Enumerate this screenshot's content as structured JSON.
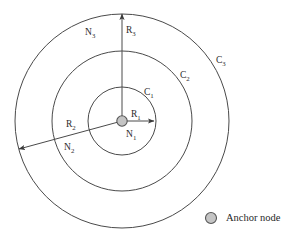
{
  "figure": {
    "background_color": "#ffffff",
    "stroke_color": "#4a4a4a",
    "node_fill_color": "#c4c4c4",
    "node_stroke_color": "#555555",
    "text_color": "#2b2b2b",
    "center": {
      "x": 122,
      "y": 121
    },
    "circles": [
      {
        "id": "C1",
        "label": "C",
        "subscript": "1",
        "radius": 34,
        "label_x": 144,
        "label_y": 88
      },
      {
        "id": "C2",
        "label": "C",
        "subscript": "2",
        "radius": 70,
        "label_x": 180,
        "label_y": 71
      },
      {
        "id": "C3",
        "label": "C",
        "subscript": "3",
        "radius": 107,
        "label_x": 216,
        "label_y": 56
      }
    ],
    "radii_arrows": [
      {
        "id": "R1",
        "label": "R",
        "subscript": "1",
        "angle_deg": 0,
        "length": 34,
        "label_x": 131,
        "label_y": 110
      },
      {
        "id": "R2",
        "label": "R",
        "subscript": "2",
        "angle_deg": 195,
        "length": 107,
        "label_x": 66,
        "label_y": 120
      },
      {
        "id": "R3",
        "label": "R",
        "subscript": "3",
        "angle_deg": 270,
        "length": 109,
        "label_x": 126,
        "label_y": 26
      }
    ],
    "region_labels": [
      {
        "id": "N1",
        "label": "N",
        "subscript": "1",
        "x": 126,
        "y": 130
      },
      {
        "id": "N2",
        "label": "N",
        "subscript": "2",
        "x": 64,
        "y": 143
      },
      {
        "id": "N3",
        "label": "N",
        "subscript": "3",
        "x": 85,
        "y": 28
      }
    ]
  },
  "legend": {
    "marker_name": "anchor-node-marker",
    "marker_x": 211,
    "marker_y": 218,
    "marker_radius": 5.5,
    "label": "Anchor node",
    "label_x": 226,
    "label_y": 213
  }
}
